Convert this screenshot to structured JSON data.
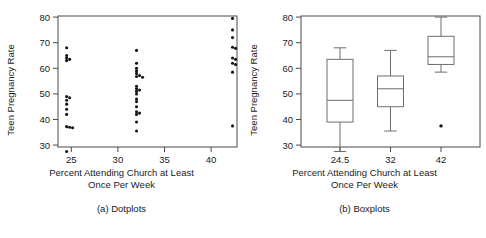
{
  "figure": {
    "panels": [
      {
        "id": "dotplots",
        "caption": "(a) Dotplots",
        "xlabel_line1": "Percent Attending Church at Least",
        "xlabel_line2": "Once Per Week",
        "ylabel": "Teen Pregnancy Rate"
      },
      {
        "id": "boxplots",
        "caption": "(b) Boxplots",
        "xlabel_line1": "Percent Attending Church at Least",
        "xlabel_line2": "Once Per Week",
        "ylabel": "Teen Pregnancy Rate"
      }
    ]
  },
  "chart_data": [
    {
      "type": "scatter",
      "id": "dotplot",
      "title": "(a) Dotplots",
      "xlabel": "Percent Attending Church at Least Once Per Week",
      "ylabel": "Teen Pregnancy Rate",
      "xlim": [
        22.5,
        44.0
      ],
      "ylim": [
        25.0,
        82.0
      ],
      "xticks": [
        25,
        30,
        35,
        40
      ],
      "yticks": [
        30,
        40,
        50,
        60,
        70,
        80
      ],
      "grid": false,
      "legend": "none",
      "groups": [
        {
          "name": "24.5",
          "x": 24.5,
          "values": [
            68.0,
            65.0,
            64.0,
            63.5,
            63.0,
            49.0,
            48.5,
            47.5,
            46.0,
            44.0,
            42.0,
            37.2,
            37.0,
            36.8,
            27.5
          ]
        },
        {
          "name": "32",
          "x": 32.0,
          "values": [
            67.0,
            62.0,
            60.0,
            59.0,
            58.0,
            57.2,
            56.8,
            56.5,
            53.0,
            52.0,
            51.5,
            51.0,
            50.0,
            48.0,
            47.0,
            45.0,
            43.0,
            42.5,
            42.0,
            39.0,
            35.5
          ]
        },
        {
          "name": "42",
          "x": 42.3,
          "values": [
            79.5,
            75.0,
            72.0,
            68.2,
            67.8,
            64.0,
            63.5,
            62.0,
            61.5,
            58.5,
            37.5
          ]
        }
      ]
    },
    {
      "type": "box",
      "id": "boxplot",
      "title": "(b) Boxplots",
      "xlabel": "Percent Attending Church at Least Once Per Week",
      "ylabel": "Teen Pregnancy Rate",
      "ylim": [
        25.0,
        82.0
      ],
      "yticks": [
        30,
        40,
        50,
        60,
        70,
        80
      ],
      "xticklabels": [
        "24.5",
        "32",
        "42"
      ],
      "grid": false,
      "legend": "none",
      "boxes": [
        {
          "label": "24.5",
          "whisker_low": 27.5,
          "q1": 39.0,
          "median": 47.5,
          "q3": 63.5,
          "whisker_high": 68.0,
          "outliers": []
        },
        {
          "label": "32",
          "whisker_low": 35.5,
          "q1": 45.0,
          "median": 52.0,
          "q3": 57.0,
          "whisker_high": 67.0,
          "outliers": []
        },
        {
          "label": "42",
          "whisker_low": 58.5,
          "q1": 61.5,
          "median": 64.5,
          "q3": 72.5,
          "whisker_high": 80.0,
          "outliers": [
            37.5
          ]
        }
      ]
    }
  ],
  "style": {
    "axis_color": "#3c3c3c",
    "dot_color": "#141414",
    "box_color": "#6e6e6e",
    "text_color": "#1a1a1a",
    "background": "#ffffff"
  }
}
